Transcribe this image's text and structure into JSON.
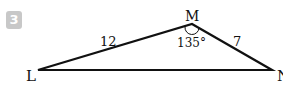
{
  "problem": {
    "number": "3"
  },
  "figure": {
    "type": "triangle",
    "vertices": {
      "left": "L",
      "top": "M",
      "right": "N"
    },
    "sides": {
      "LM": "12",
      "MN": "7"
    },
    "angle": {
      "at": "M",
      "value": "135°"
    },
    "colors": {
      "stroke": "#111111",
      "badge": "#c8c8c8"
    }
  }
}
